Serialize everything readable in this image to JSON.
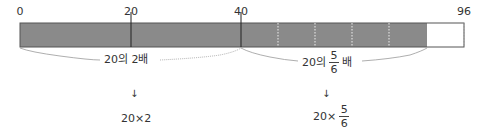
{
  "diagram": {
    "ticks": [
      {
        "label": "0",
        "x": 20
      },
      {
        "label": "20",
        "x": 131
      },
      {
        "label": "40",
        "x": 241
      },
      {
        "label": "96",
        "x": 464
      }
    ],
    "bar": {
      "x0": 20,
      "x1": 464,
      "top": 23,
      "bottom": 47,
      "fill_color": "#8a8a8a",
      "filled_end": 427,
      "solid_dividers": [
        131,
        241
      ],
      "dotted_dividers": [
        278,
        315,
        352,
        389
      ]
    },
    "left_group": {
      "label_prefix": "20의 2배",
      "arrow": "↓",
      "expression": "20×2"
    },
    "right_group": {
      "label_prefix": "20의",
      "fraction_num": "5",
      "fraction_den": "6",
      "label_suffix": "배",
      "arrow": "↓",
      "expr_prefix": "20×",
      "expr_num": "5",
      "expr_den": "6"
    }
  }
}
